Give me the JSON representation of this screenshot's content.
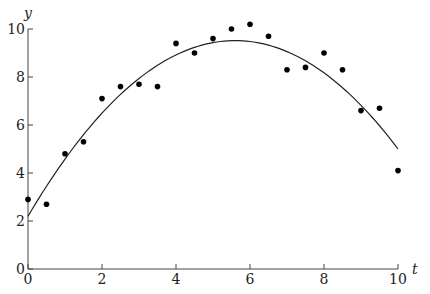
{
  "chart_data": {
    "type": "scatter",
    "title": "",
    "xlabel": "t",
    "ylabel": "y",
    "xlim": [
      0,
      10
    ],
    "ylim": [
      0,
      10
    ],
    "xticks": [
      "0",
      "2",
      "4",
      "6",
      "8",
      "10"
    ],
    "yticks": [
      "0",
      "2",
      "4",
      "6",
      "8",
      "10"
    ],
    "grid": false,
    "series": [
      {
        "name": "data",
        "kind": "scatter",
        "x": [
          0,
          0.5,
          1,
          1.5,
          2,
          2.5,
          3,
          3.5,
          4,
          4.5,
          5,
          5.5,
          6,
          6.5,
          7,
          7.5,
          8,
          8.5,
          9,
          9.5,
          10
        ],
        "y": [
          2.9,
          2.7,
          4.8,
          5.3,
          7.1,
          7.6,
          7.7,
          7.6,
          9.4,
          9.0,
          9.6,
          10.0,
          10.2,
          9.7,
          8.3,
          8.4,
          9.0,
          8.3,
          6.6,
          6.7,
          4.1
        ],
        "color": "#000000"
      },
      {
        "name": "fitted curve",
        "kind": "line",
        "model": "quadratic",
        "coefficients": [
          2.2,
          2.613,
          -0.2333
        ],
        "color": "#222222"
      }
    ]
  }
}
